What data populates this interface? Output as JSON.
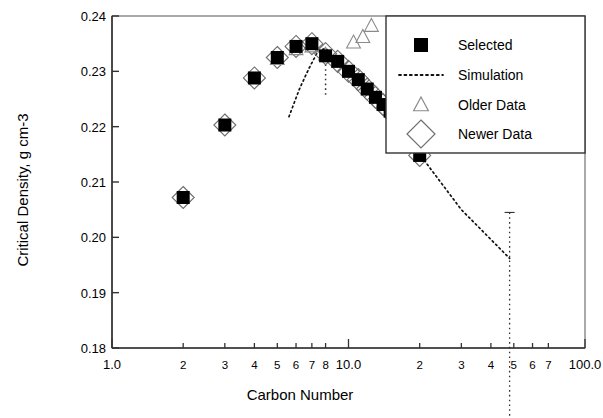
{
  "chart_data": {
    "type": "scatter",
    "title": "",
    "xlabel": "Carbon Number",
    "ylabel": "Critical Density, g cm-3",
    "xscale": "log",
    "yscale": "linear",
    "xlim": [
      1.0,
      100.0
    ],
    "ylim": [
      0.18,
      0.24
    ],
    "grid": false,
    "legend_position": "top-right",
    "x_tick_labels": [
      "1.0",
      "2",
      "3",
      "4",
      "5",
      "6",
      "7",
      "8",
      "10.0",
      "2",
      "3",
      "4",
      "5",
      "6",
      "7",
      "100.0"
    ],
    "x_tick_values": [
      1,
      2,
      3,
      4,
      5,
      6,
      7,
      8,
      10,
      20,
      30,
      40,
      50,
      60,
      70,
      100
    ],
    "y_tick_labels": [
      "0.18",
      "0.19",
      "0.20",
      "0.21",
      "0.22",
      "0.23",
      "0.24"
    ],
    "y_tick_values": [
      0.18,
      0.19,
      0.2,
      0.21,
      0.22,
      0.23,
      0.24
    ],
    "series": [
      {
        "name": "Selected",
        "marker": "filled-square",
        "color": "#000000",
        "points": [
          {
            "x": 2,
            "y": 0.2072
          },
          {
            "x": 3,
            "y": 0.2203
          },
          {
            "x": 4,
            "y": 0.2288
          },
          {
            "x": 5,
            "y": 0.2325
          },
          {
            "x": 6,
            "y": 0.2345
          },
          {
            "x": 7,
            "y": 0.235
          },
          {
            "x": 8,
            "y": 0.2328
          },
          {
            "x": 9,
            "y": 0.2318
          },
          {
            "x": 10,
            "y": 0.23
          },
          {
            "x": 11,
            "y": 0.2285
          },
          {
            "x": 12,
            "y": 0.2268
          },
          {
            "x": 13,
            "y": 0.2253
          },
          {
            "x": 14,
            "y": 0.224
          },
          {
            "x": 15,
            "y": 0.2228
          },
          {
            "x": 16,
            "y": 0.2215
          },
          {
            "x": 17,
            "y": 0.2203
          },
          {
            "x": 18,
            "y": 0.2192
          },
          {
            "x": 20,
            "y": 0.2148
          }
        ]
      },
      {
        "name": "Newer Data",
        "marker": "open-diamond",
        "color": "#6e6e6e",
        "points": [
          {
            "x": 2,
            "y": 0.2072
          },
          {
            "x": 3,
            "y": 0.2203
          },
          {
            "x": 4,
            "y": 0.2288
          },
          {
            "x": 5,
            "y": 0.2325
          },
          {
            "x": 6,
            "y": 0.2345
          },
          {
            "x": 7,
            "y": 0.235
          },
          {
            "x": 8,
            "y": 0.2332
          },
          {
            "x": 9,
            "y": 0.2318
          },
          {
            "x": 10,
            "y": 0.23
          },
          {
            "x": 11,
            "y": 0.2285
          },
          {
            "x": 12,
            "y": 0.2268
          },
          {
            "x": 13,
            "y": 0.2253
          },
          {
            "x": 14,
            "y": 0.224
          },
          {
            "x": 15,
            "y": 0.2228
          },
          {
            "x": 16,
            "y": 0.2215
          },
          {
            "x": 17,
            "y": 0.2203
          },
          {
            "x": 18,
            "y": 0.2192
          },
          {
            "x": 20,
            "y": 0.2148
          }
        ]
      },
      {
        "name": "Older Data",
        "marker": "open-triangle",
        "color": "#8a8a8a",
        "points": [
          {
            "x": 5,
            "y": 0.2322
          },
          {
            "x": 6,
            "y": 0.234
          },
          {
            "x": 7,
            "y": 0.2345
          },
          {
            "x": 8,
            "y": 0.233
          },
          {
            "x": 10.5,
            "y": 0.2352
          },
          {
            "x": 11.5,
            "y": 0.2362
          },
          {
            "x": 12.5,
            "y": 0.2382
          }
        ]
      },
      {
        "name": "Simulation",
        "marker": "dotted-line",
        "color": "#111111",
        "points": [
          {
            "x": 5.6,
            "y": 0.2218
          },
          {
            "x": 6.2,
            "y": 0.2268
          },
          {
            "x": 6.8,
            "y": 0.2305
          },
          {
            "x": 7.4,
            "y": 0.2335
          },
          {
            "x": 8.0,
            "y": 0.2342
          },
          {
            "x": 9.0,
            "y": 0.2318
          },
          {
            "x": 12.0,
            "y": 0.2268
          },
          {
            "x": 16.0,
            "y": 0.2218
          },
          {
            "x": 20.0,
            "y": 0.215
          },
          {
            "x": 30.0,
            "y": 0.205
          },
          {
            "x": 48.0,
            "y": 0.1962
          }
        ]
      }
    ],
    "annotations": [
      {
        "type": "vertical-dotted-line",
        "x": 48.0,
        "y_top": 0.2045,
        "y_bottom": 0.18
      },
      {
        "type": "dotted-drop",
        "x": 8.0,
        "y_top": 0.233,
        "y_bottom": 0.2255
      }
    ],
    "legend_entries": [
      {
        "label": "Selected",
        "marker": "filled-square"
      },
      {
        "label": "Simulation",
        "marker": "dotted-line"
      },
      {
        "label": "Older Data",
        "marker": "open-triangle"
      },
      {
        "label": "Newer Data",
        "marker": "open-diamond"
      }
    ]
  }
}
